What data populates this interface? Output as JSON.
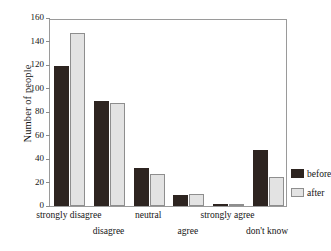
{
  "chart_data": {
    "type": "bar",
    "title": "",
    "xlabel": "",
    "ylabel": "Number of people",
    "categories": [
      "strongly disagree",
      "disagree",
      "neutral",
      "agree",
      "strongly agree",
      "don't know"
    ],
    "series": [
      {
        "name": "before",
        "color": "#2d2420",
        "values": [
          119,
          89,
          32,
          9,
          1,
          48
        ]
      },
      {
        "name": "after",
        "color": "#e3e3e3",
        "values": [
          147,
          88,
          27,
          10,
          1,
          25
        ]
      }
    ],
    "ylim": [
      0,
      160
    ],
    "yticks": [
      0,
      20,
      40,
      60,
      80,
      100,
      120,
      140,
      160
    ],
    "ytick_labels": [
      "0",
      "20",
      "40",
      "60",
      "80",
      "100",
      "120",
      "140",
      "160"
    ],
    "grid": false,
    "legend_position": "right"
  },
  "legend": {
    "entries": [
      {
        "label": "before"
      },
      {
        "label": "after"
      }
    ]
  },
  "axes": {
    "y_title": "Number of people"
  }
}
